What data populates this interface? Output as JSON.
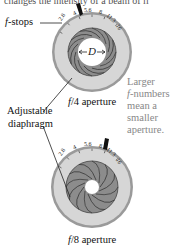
{
  "header_fragment": "changes the intensity of a beam of li",
  "labels": {
    "fstops": "f-stops",
    "fstops_italic": "f",
    "fstops_rest": "-stops",
    "diaphragm_line1": "Adjustable",
    "diaphragm_line2": "diaphragm",
    "diameter": "D"
  },
  "note": {
    "line1": "Larger",
    "line2_italic": "f",
    "line2_rest": "-numbers",
    "line3": "mean a",
    "line4": "smaller",
    "line5": "aperture."
  },
  "apertures": [
    {
      "caption_f": "f",
      "caption_rest": "/4 aperture",
      "hole_radius": 14,
      "pointer_at": "4"
    },
    {
      "caption_f": "f",
      "caption_rest": "/8 aperture",
      "hole_radius": 7,
      "pointer_at": "8"
    }
  ],
  "fstop_scale": [
    "2.8",
    "4",
    "5.6",
    "8",
    "11.3",
    "16"
  ],
  "colors": {
    "ring_outer": "#9a9a9a",
    "ring_face": "#d6d6d6",
    "blade_fill": "#8c8c8c",
    "blade_line": "#3a3a3a",
    "note_text": "#888888"
  }
}
